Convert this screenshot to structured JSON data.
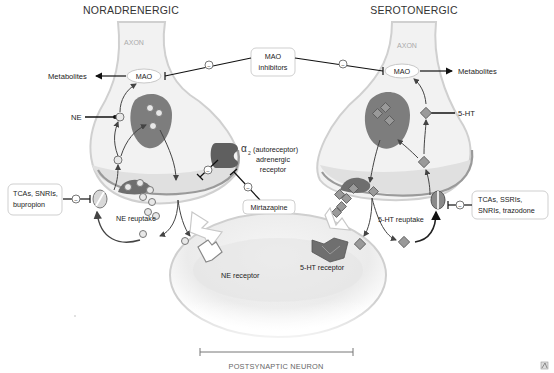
{
  "titles": {
    "left": "NORADRENERGIC",
    "right": "SEROTONERGIC"
  },
  "labels": {
    "axon_left": "AXON",
    "axon_right": "AXON",
    "mao_left": "MAO",
    "mao_right": "MAO",
    "metabolites_left": "Metabolites",
    "metabolites_right": "Metabolites",
    "ne": "NE",
    "five_ht": "5-HT",
    "alpha_symbol": "α",
    "alpha_sub": "2",
    "alpha_line1": "(autoreceptor)",
    "alpha_line2": "adrenergic",
    "alpha_line3": "receptor",
    "ne_reuptake": "NE reuptake",
    "ht_reuptake": "5-HT reuptake",
    "ne_receptor": "NE receptor",
    "ht_receptor": "5-HT receptor",
    "postsynaptic": "POSTSYNAPTIC NEURON",
    "inhibit_symbol": "−"
  },
  "drug_boxes": {
    "mao_inhibitors": [
      "MAO",
      "inhibitors"
    ],
    "mirtazapine": [
      "Mirtazapine"
    ],
    "ne_blockers": [
      "TCAs, SNRIs,",
      "bupropion"
    ],
    "ht_blockers": [
      "TCAs, SSRIs,",
      "SNRIs, trazodone"
    ]
  },
  "colors": {
    "axon_fill": "#f0f0f0",
    "axon_stroke": "#c8c8c8",
    "terminal_fill": "#e2e2e2",
    "vesicle": "#7a7a7a",
    "molecule": "#d6d6d6",
    "line": "#222222",
    "box_stroke": "#cfcfcf"
  }
}
